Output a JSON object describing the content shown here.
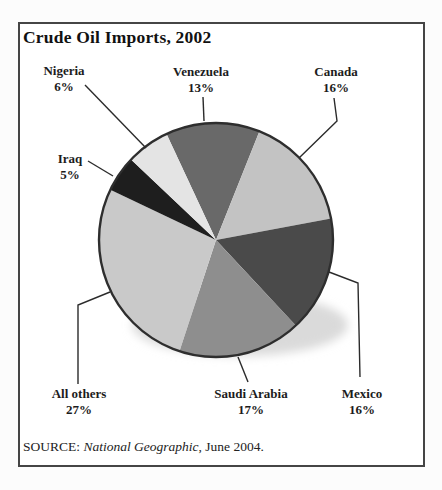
{
  "title": "Crude Oil Imports, 2002",
  "source": {
    "prefix": "SOURCE: ",
    "publication": "National Geographic",
    "suffix": ", June 2004."
  },
  "chart_data": {
    "type": "pie",
    "title": "Crude Oil Imports, 2002",
    "unit": "%",
    "start_angle_deg_from_top": -25,
    "direction": "clockwise",
    "legend": "none",
    "labels_layout": "outside with leader lines",
    "outline_color": "#2e2e2e",
    "shadow_color": "#dadada",
    "slices": [
      {
        "label": "Venezuela",
        "value": 13,
        "color": "#696969"
      },
      {
        "label": "Canada",
        "value": 16,
        "color": "#c3c3c3"
      },
      {
        "label": "Mexico",
        "value": 16,
        "color": "#4a4a4a"
      },
      {
        "label": "Saudi Arabia",
        "value": 17,
        "color": "#8e8e8e"
      },
      {
        "label": "All others",
        "value": 27,
        "color": "#c9c9c9"
      },
      {
        "label": "Iraq",
        "value": 5,
        "color": "#1e1e1e"
      },
      {
        "label": "Nigeria",
        "value": 6,
        "color": "#e4e4e4"
      }
    ]
  }
}
